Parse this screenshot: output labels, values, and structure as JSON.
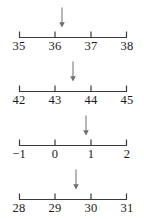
{
  "figure": {
    "type": "number-lines",
    "line_color": "#3a3a3a",
    "label_color": "#1a1a1a",
    "arrow_color": "#6e6e6e",
    "background": "#ffffff",
    "axis_left_px": 19,
    "axis_right_px": 127,
    "lines": [
      {
        "id": "line-1",
        "labels": [
          "35",
          "36",
          "37",
          "38"
        ],
        "values": [
          35,
          36,
          37,
          38
        ],
        "tick_positions_px": [
          19,
          55,
          91,
          127
        ],
        "arrow": {
          "label": "arrow-marker",
          "position_px": 62,
          "approx_value": 36.2
        }
      },
      {
        "id": "line-2",
        "labels": [
          "42",
          "43",
          "44",
          "45"
        ],
        "values": [
          42,
          43,
          44,
          45
        ],
        "tick_positions_px": [
          19,
          55,
          91,
          127
        ],
        "arrow": {
          "label": "arrow-marker",
          "position_px": 73,
          "approx_value": 43.5
        }
      },
      {
        "id": "line-3",
        "labels": [
          "−1",
          "0",
          "1",
          "2"
        ],
        "values": [
          -1,
          0,
          1,
          2
        ],
        "tick_positions_px": [
          19,
          55,
          91,
          127
        ],
        "arrow": {
          "label": "arrow-marker",
          "position_px": 86,
          "approx_value": 0.85
        }
      },
      {
        "id": "line-4",
        "labels": [
          "28",
          "29",
          "30",
          "31"
        ],
        "values": [
          28,
          29,
          30,
          31
        ],
        "tick_positions_px": [
          19,
          55,
          91,
          127
        ],
        "arrow": {
          "label": "arrow-marker",
          "position_px": 76,
          "approx_value": 29.6
        }
      }
    ]
  }
}
